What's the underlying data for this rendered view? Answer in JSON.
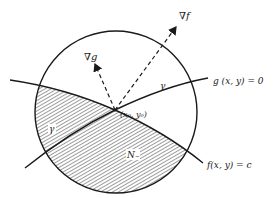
{
  "diagram": {
    "labels": {
      "grad_f": "∇f",
      "grad_g": "∇g",
      "gamma_upper": "γ",
      "gamma_lower": "γ",
      "point": "(x₀, y₀)",
      "region": "N₋",
      "curve_g": "g (x, y) = 0",
      "curve_f": "f(x, y) = c"
    },
    "colors": {
      "ink": "#1a1a1a",
      "background": "#ffffff",
      "hatch": "#3a3a3a"
    }
  }
}
